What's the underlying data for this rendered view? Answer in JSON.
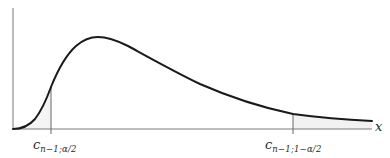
{
  "figure": {
    "x_axis_label": "x",
    "critical_values": [
      {
        "symbol": "c",
        "subscript": "n−1;α/2",
        "position": "left"
      },
      {
        "symbol": "c",
        "subscript": "n−1;1−α/2",
        "position": "right"
      }
    ],
    "colors": {
      "curve": "#1a1a1a",
      "axes": "#777777",
      "shaded_tail": "#f2f2f2"
    }
  }
}
